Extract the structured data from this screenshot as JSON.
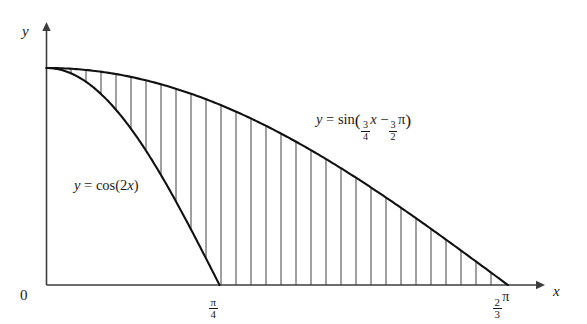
{
  "figure": {
    "background_color": "#ffffff",
    "curve_color": "#111111",
    "axis_color": "#3d3d3d",
    "hatch_color": "#4a4a4a"
  },
  "axes": {
    "y_axis_label": "y",
    "x_axis_label": "x",
    "origin_label": "0",
    "x_ticks": [
      {
        "id": "pi-over-4",
        "numerator": "π",
        "denominator": "4",
        "suffix": "",
        "value": 0.7853981634
      },
      {
        "id": "two-thirds-pi",
        "numerator": "2",
        "denominator": "3",
        "suffix": "π",
        "value": 2.0943951024
      }
    ],
    "y_ticks": []
  },
  "labels": {
    "cos_curve": {
      "lhs": "y",
      "equals": "=",
      "rhs": "cos(2x)",
      "full_text": "y = cos(2x)"
    },
    "sin_curve": {
      "lhs": "y",
      "equals": "=",
      "fn": "sin",
      "open_paren": "(",
      "coef_num": "3",
      "coef_den": "4",
      "var": "x",
      "minus": "−",
      "const_num": "3",
      "const_den": "2",
      "pi": "π",
      "close_paren": ")",
      "full_text": "y = sin (3/4 x − 3/2 π)"
    }
  },
  "chart_data": {
    "type": "line",
    "title": "",
    "xlabel": "x",
    "ylabel": "y",
    "xlim": [
      0,
      2.35619449
    ],
    "ylim": [
      0,
      1.12
    ],
    "grid": false,
    "legend": "inline-annotations",
    "shaded_region": {
      "description": "vertical hatching between the two curves from x = 0 to x = 2/3 pi",
      "hatch_style": "vertical-lines",
      "hatch_count": 30,
      "x_start": 0.0,
      "x_end": 2.0943951024,
      "upper_curve": "sin",
      "lower_curve_piecewise": "cos(2x) for 0 <= x <= pi/4, then y = 0 for x > pi/4"
    },
    "series": [
      {
        "name": "y = cos(2x)",
        "expression": "cos(2*x)",
        "domain": [
          0,
          0.7853981634
        ],
        "x": [
          0.0,
          0.0982,
          0.1963,
          0.2945,
          0.3927,
          0.4909,
          0.589,
          0.6872,
          0.7854
        ],
        "y": [
          1.0,
          0.9808,
          0.9239,
          0.8315,
          0.7071,
          0.5556,
          0.3827,
          0.1951,
          0.0
        ],
        "x_intercept": 0.7853981634,
        "y_intercept": 1.0
      },
      {
        "name": "y = sin(3/4 x - 3/2 pi)",
        "expression": "sin(0.75*x - 1.5*pi)",
        "domain": [
          0,
          2.0943951024
        ],
        "x": [
          0.0,
          0.2618,
          0.5236,
          0.7854,
          1.0472,
          1.309,
          1.5708,
          1.8326,
          2.0944
        ],
        "y": [
          1.0,
          0.9808,
          0.9239,
          0.8315,
          0.7071,
          0.5556,
          0.3827,
          0.1951,
          0.0
        ],
        "x_intercept": 2.0943951024,
        "y_intercept": 1.0
      }
    ],
    "intersection_points": [
      {
        "x": 0.0,
        "y": 1.0,
        "note": "both curves start at y = 1"
      },
      {
        "x": 0.7853981634,
        "y": 0.0,
        "note": "cos(2x) meets the x-axis at pi/4"
      },
      {
        "x": 2.0943951024,
        "y": 0.0,
        "note": "sine curve meets the x-axis at 2/3 pi"
      }
    ]
  },
  "geometry": {
    "origin_px": {
      "x": 46.5,
      "y": 285.0
    },
    "x_axis_end_px": 545.0,
    "y_axis_top_px": 22.0,
    "px_per_unit_x": 220.3,
    "px_per_unit_y": 217.0,
    "hatch_spacing_px": 15.0,
    "hatch_first_px": 71.0,
    "hatch_last_px": 500.0
  }
}
